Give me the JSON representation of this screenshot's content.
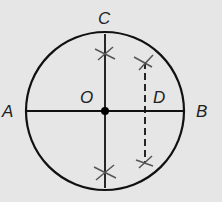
{
  "diagram": {
    "labels": {
      "A": "A",
      "B": "B",
      "C": "C",
      "O": "O",
      "D": "D"
    },
    "colors": {
      "background": "#e6e6e6",
      "stroke": "#111111",
      "marks": "#555555"
    }
  }
}
